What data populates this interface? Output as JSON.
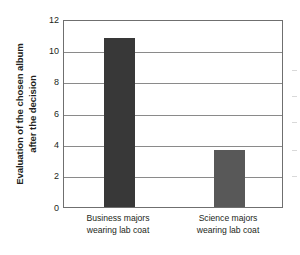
{
  "chart_data": {
    "type": "bar",
    "title": "",
    "xlabel": "",
    "ylabel": "Evaluation of the chosen album after the decision",
    "ylabel_lines": [
      "Evaluation of the chosen album",
      "after the decision"
    ],
    "categories": [
      "Business majors wearing lab coat",
      "Science majors wearing lab coat"
    ],
    "category_lines": [
      [
        "Business majors",
        "wearing lab coat"
      ],
      [
        "Science majors",
        "wearing lab coat"
      ]
    ],
    "values": [
      10.8,
      3.65
    ],
    "ylim": [
      0,
      12
    ],
    "ytick_values": [
      0,
      2,
      4,
      6,
      8,
      10,
      12
    ],
    "ytick_labels": [
      "0",
      "2",
      "4",
      "6",
      "8",
      "10",
      "12"
    ],
    "grid": true,
    "legend": "none",
    "bar_colors": [
      "#383838",
      "#585858"
    ],
    "frame_color": "#6f6f6f",
    "gridline_color": "#8a8a8a",
    "background_color": "#ffffff",
    "text_color": "#231f20"
  }
}
